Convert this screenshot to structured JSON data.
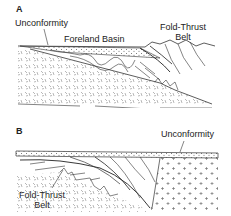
{
  "panels": [
    {
      "id": "A",
      "letter": "A",
      "labels": {
        "unconformity": "Unconformity",
        "foreland_basin": "Foreland Basin",
        "fold_thrust_line1": "Fold-Thrust",
        "fold_thrust_line2": "Belt"
      }
    },
    {
      "id": "B",
      "letter": "B",
      "labels": {
        "unconformity": "Unconformity",
        "fold_thrust_line1": "Fold-Thrust",
        "fold_thrust_line2": "Belt"
      }
    }
  ],
  "colors": {
    "line": "#333333",
    "pattern": "#777777",
    "background": "#ffffff"
  }
}
